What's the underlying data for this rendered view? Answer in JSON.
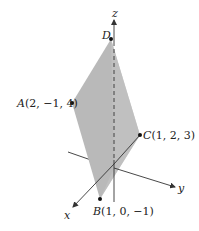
{
  "figure": {
    "type": "3d-parallelogram",
    "plane_fill": "#b7b7b7",
    "plane_fill_light": "#c9c9c9",
    "axis_color": "#333333",
    "axes": {
      "x": {
        "label": "x"
      },
      "y": {
        "label": "y"
      },
      "z": {
        "label": "z"
      }
    },
    "points": [
      {
        "id": "A",
        "label_name": "A",
        "coords": "(2, −1, 4)"
      },
      {
        "id": "B",
        "label_name": "B",
        "coords": "(1, 0, −1)"
      },
      {
        "id": "C",
        "label_name": "C",
        "coords": "(1, 2, 3)"
      },
      {
        "id": "D",
        "label_name": "D",
        "coords": ""
      }
    ]
  }
}
